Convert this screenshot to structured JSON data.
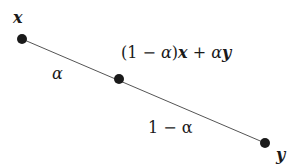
{
  "diagram": {
    "points": [
      {
        "id": "x",
        "label": "x",
        "cx": 22,
        "cy": 39
      },
      {
        "id": "mid",
        "label": "(1 − α)x + αy",
        "cx": 119,
        "cy": 79
      },
      {
        "id": "y",
        "label": "y",
        "cx": 265,
        "cy": 143
      }
    ],
    "segment_labels": {
      "alpha": "α",
      "one_minus_alpha": "1 − α"
    },
    "mid_label_parts": {
      "open": "(1 − ",
      "alpha1": "α",
      "close": ")",
      "x": "x",
      "plus": " + ",
      "alpha2": "α",
      "y": "y"
    },
    "colors": {
      "line": "#555555",
      "point": "#1a1a1a",
      "text": "#1a1a1a"
    }
  }
}
